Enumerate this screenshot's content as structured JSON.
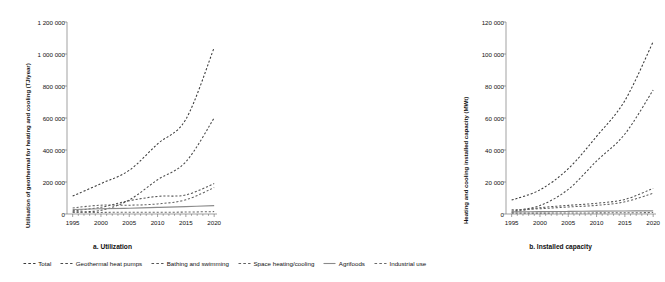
{
  "figure": {
    "panels": [
      {
        "id": "a",
        "caption": "a. Utilization",
        "ylabel": "Utilisation of geothermal for heating and cooling (TJ/year)",
        "yticks": [
          "0",
          "200 000",
          "400 000",
          "600 000",
          "800 000",
          "1 000 000",
          "1 200 000"
        ],
        "xticks": [
          "1995",
          "2000",
          "2005",
          "2010",
          "2015",
          "2020"
        ]
      },
      {
        "id": "b",
        "caption": "b. Installed capacity",
        "ylabel": "Heating and cooling installed capacity (MWt)",
        "yticks": [
          "0",
          "20 000",
          "40 000",
          "60 000",
          "80 000",
          "100 000",
          "120 000"
        ],
        "xticks": [
          "1995",
          "2000",
          "2005",
          "2010",
          "2015",
          "2020"
        ]
      }
    ]
  },
  "legend": {
    "items": [
      {
        "label": "Total",
        "style": "dashed",
        "color": "#3a3a3a"
      },
      {
        "label": "Geothermal heat pumps",
        "style": "dashed",
        "color": "#4a4a4a"
      },
      {
        "label": "Bathing and swimming",
        "style": "dashed",
        "color": "#555555"
      },
      {
        "label": "Space heating/cooling",
        "style": "dashed",
        "color": "#606060"
      },
      {
        "label": "Agrifoods",
        "style": "solid",
        "color": "#8a8a8a"
      },
      {
        "label": "Industrial use",
        "style": "dashed",
        "color": "#6a6a6a"
      }
    ]
  },
  "chart_data": [
    {
      "type": "line",
      "panel": "a",
      "title": "a. Utilization",
      "xlabel": "",
      "ylabel": "Utilisation of geothermal for heating and cooling (TJ/year)",
      "xlim": [
        1994,
        2020.5
      ],
      "ylim": [
        0,
        1200000
      ],
      "ytick_values": [
        0,
        200000,
        400000,
        600000,
        800000,
        1000000,
        1200000
      ],
      "xtick_values": [
        1995,
        2000,
        2005,
        2010,
        2015,
        2020
      ],
      "grid": false,
      "legend_position": "below-figure",
      "x": [
        1995,
        2000,
        2005,
        2010,
        2015,
        2020
      ],
      "series": [
        {
          "name": "Total",
          "style": "dashed",
          "color": "#3a3a3a",
          "values": [
            112000,
            190000,
            273000,
            438000,
            592000,
            1040000
          ]
        },
        {
          "name": "Geothermal heat pumps",
          "style": "dashed",
          "color": "#4a4a4a",
          "values": [
            14000,
            23000,
            88000,
            214000,
            326000,
            600000
          ]
        },
        {
          "name": "Bathing and swimming",
          "style": "dashed",
          "color": "#555555",
          "values": [
            20000,
            42000,
            83000,
            110000,
            119000,
            190000
          ]
        },
        {
          "name": "Space heating/cooling",
          "style": "dashed",
          "color": "#606060",
          "values": [
            38000,
            55000,
            55000,
            63000,
            89000,
            165000
          ]
        },
        {
          "name": "Agrifoods",
          "style": "solid",
          "color": "#8a8a8a",
          "values": [
            28000,
            33000,
            36000,
            41000,
            46000,
            52000
          ]
        },
        {
          "name": "Industrial use",
          "style": "dashed",
          "color": "#6a6a6a",
          "values": [
            10000,
            10000,
            11000,
            11000,
            12000,
            15000
          ]
        }
      ]
    },
    {
      "type": "line",
      "panel": "b",
      "title": "b. Installed capacity",
      "xlabel": "",
      "ylabel": "Heating and cooling installed capacity (MWt)",
      "xlim": [
        1994,
        2020.5
      ],
      "ylim": [
        0,
        120000
      ],
      "ytick_values": [
        0,
        20000,
        40000,
        60000,
        80000,
        100000,
        120000
      ],
      "xtick_values": [
        1995,
        2000,
        2005,
        2010,
        2015,
        2020
      ],
      "grid": false,
      "legend_position": "below-figure",
      "x": [
        1995,
        2000,
        2005,
        2010,
        2015,
        2020
      ],
      "series": [
        {
          "name": "Total",
          "style": "dashed",
          "color": "#3a3a3a",
          "values": [
            8700,
            15100,
            28300,
            48500,
            70900,
            107700
          ]
        },
        {
          "name": "Geothermal heat pumps",
          "style": "dashed",
          "color": "#4a4a4a",
          "values": [
            1850,
            5300,
            15400,
            33100,
            50000,
            77500
          ]
        },
        {
          "name": "Bathing and swimming",
          "style": "dashed",
          "color": "#555555",
          "values": [
            1100,
            3900,
            5400,
            6700,
            9100,
            16000
          ]
        },
        {
          "name": "Space heating/cooling",
          "style": "dashed",
          "color": "#606060",
          "values": [
            2600,
            3300,
            4400,
            5400,
            7600,
            13000
          ]
        },
        {
          "name": "Agrifoods",
          "style": "solid",
          "color": "#8a8a8a",
          "values": [
            1300,
            1500,
            1600,
            1800,
            1900,
            2000
          ]
        },
        {
          "name": "Industrial use",
          "style": "dashed",
          "color": "#6a6a6a",
          "values": [
            550,
            550,
            600,
            700,
            750,
            900
          ]
        }
      ]
    }
  ]
}
